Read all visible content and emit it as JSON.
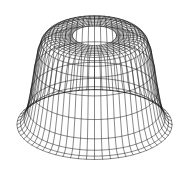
{
  "page": {
    "background_color": "#ffffff"
  },
  "figure": {
    "canvas_width": 185,
    "canvas_height": 179,
    "line_color": "#161616",
    "line_opacity": 0.92,
    "line_width": 0.55
  },
  "chart_data": {
    "type": "wireframe",
    "subtype": "surface-of-revolution-mesh",
    "mesh": {
      "n_theta": 60,
      "theta_range_deg": [
        0,
        360
      ],
      "profile": {
        "radius": [
          0.284,
          0.329,
          0.374,
          0.418,
          0.463,
          0.508,
          0.553,
          0.597,
          0.642,
          0.687,
          0.732,
          0.776,
          0.821,
          0.866,
          0.911,
          0.955,
          1.0
        ],
        "height": [
          1.3,
          1.3,
          1.3,
          1.299,
          1.299,
          1.298,
          1.295,
          1.286,
          1.262,
          1.203,
          1.067,
          0.82,
          0.501,
          0.245,
          0.103,
          0.04,
          0.015
        ]
      },
      "inner_opening_radius": 0.284,
      "outer_base_radius": 1.0,
      "plateau_height": 1.3
    },
    "view": {
      "projection": "orthographic",
      "elevation_deg": 26.74,
      "azimuth_deg": 0,
      "hidden_line_removal": false
    },
    "screen_mapping": {
      "center_x": 94.5,
      "base_y": 125.6,
      "scale": 77.5
    }
  }
}
